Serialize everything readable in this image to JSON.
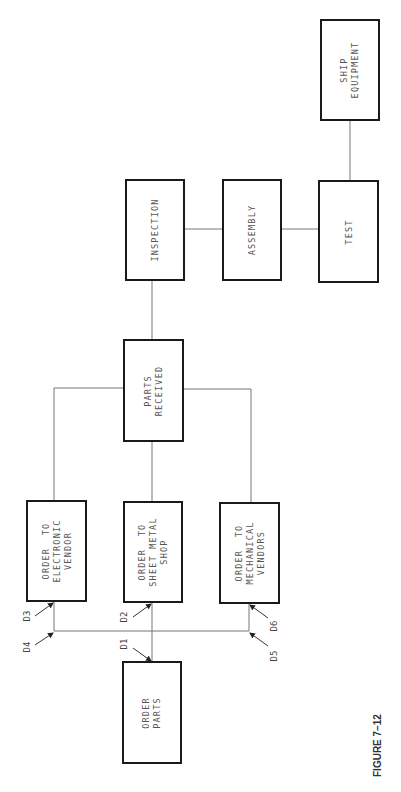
{
  "figure": {
    "caption": "FIGURE 7–12"
  },
  "boxes": {
    "order_parts": "ORDER\nPARTS",
    "order_electronic": "ORDER  TO\nELECTRONIC\nVENDOR",
    "order_sheet_metal": "ORDER  TO\nSHEET METAL\nSHOP",
    "order_mechanical": "ORDER  TO\nMECHANICAL\nVENDORS",
    "parts_received": "PARTS\nRECEIVED",
    "inspection": "INSPECTION",
    "assembly": "ASSEMBLY",
    "test": "TEST",
    "ship_equipment": "SHIP\nEQUIPMENT"
  },
  "labels": {
    "d1": "D1",
    "d2": "D2",
    "d3": "D3",
    "d4": "D4",
    "d5": "D5",
    "d6": "D6"
  },
  "colors": {
    "box_border": "#1a1a1a",
    "line": "#666666",
    "text": "#555555"
  }
}
